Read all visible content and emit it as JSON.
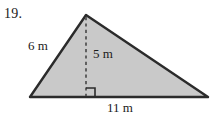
{
  "page": {
    "background_color": "#ffffff",
    "problem_number": "19."
  },
  "figure": {
    "type": "triangle-with-altitude",
    "fill_color": "#c9c9c9",
    "stroke_color": "#2b2b2b",
    "dashed_stroke_color": "#555555",
    "vertices": {
      "apex": {
        "x": 86,
        "y": 15
      },
      "bottom_left": {
        "x": 30,
        "y": 97
      },
      "bottom_right": {
        "x": 208,
        "y": 97
      }
    },
    "altitude": {
      "from": {
        "x": 86,
        "y": 15
      },
      "to": {
        "x": 86,
        "y": 97
      },
      "style": "dashed"
    },
    "right_angle_marker": {
      "x": 86,
      "y": 97,
      "size": 9,
      "orientation": "right-of-altitude"
    },
    "labels": {
      "left_side": "6 m",
      "height": "5 m",
      "base": "11 m"
    }
  }
}
